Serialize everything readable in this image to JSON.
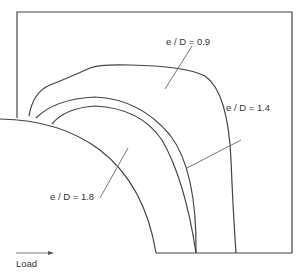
{
  "diagram": {
    "labels": {
      "curve_09": "e / D = 0.9",
      "curve_14": "e / D = 1.4",
      "curve_18": "e / D = 1.8",
      "load": "Load"
    },
    "line_color": "#444444",
    "background": "#ffffff"
  }
}
